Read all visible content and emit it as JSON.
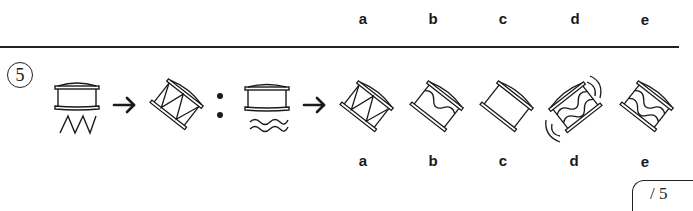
{
  "previous_question": {
    "option_labels": [
      "a",
      "b",
      "c",
      "d",
      "e"
    ]
  },
  "question": {
    "number": "5",
    "analogy": {
      "item_1": "upright drum with zigzag line below",
      "item_2": "tilted drum with zigzag pattern on body",
      "separator": ":",
      "item_3": "upright drum with wavy lines below"
    },
    "options": [
      {
        "label": "a",
        "description": "tilted drum with zigzag pattern"
      },
      {
        "label": "b",
        "description": "tilted drum with single wavy line"
      },
      {
        "label": "c",
        "description": "tilted plain drum"
      },
      {
        "label": "d",
        "description": "drum tilted other way with wavy lines and sound arcs"
      },
      {
        "label": "e",
        "description": "tilted drum with two wavy lines"
      }
    ]
  },
  "score_box": {
    "text": "/ 5"
  },
  "colors": {
    "ink": "#1a1a1a",
    "background": "#ffffff"
  }
}
